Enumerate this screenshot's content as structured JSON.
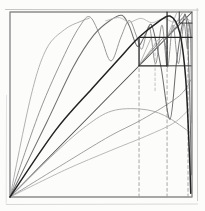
{
  "figure": {
    "background": "#fcfcfb",
    "frame_px": {
      "left": 10,
      "top": 12,
      "right": 192,
      "bottom": 197
    },
    "strokes": [
      {
        "name": "scan-artifact-top",
        "color": "#c6c6c6",
        "width": 1.0,
        "smooth": false,
        "points": [
          [
            -0.025,
            1.0135
          ],
          [
            1.035,
            1.0105
          ]
        ]
      },
      {
        "name": "scan-artifact-right",
        "color": "#c6c6c6",
        "width": 0.9,
        "smooth": false,
        "points": [
          [
            1.0285,
            1.02
          ],
          [
            1.0305,
            -0.02
          ]
        ]
      },
      {
        "name": "scan-artifact-bottom",
        "color": "#d9d9d9",
        "width": 1.0,
        "smooth": false,
        "points": [
          [
            -0.02,
            -0.0405
          ],
          [
            1.03,
            -0.038
          ]
        ]
      },
      {
        "name": "scan-artifact-left",
        "color": "#e0e0e0",
        "width": 0.9,
        "smooth": false,
        "points": [
          [
            -0.019,
            0.55
          ],
          [
            -0.021,
            -0.035
          ]
        ]
      },
      {
        "name": "outer-square-border",
        "color": "#8a8a8a",
        "width": 1.4,
        "smooth": false,
        "points": [
          [
            0,
            0
          ],
          [
            1,
            0
          ],
          [
            1,
            1
          ],
          [
            0,
            1
          ],
          [
            0,
            0
          ]
        ]
      },
      {
        "name": "dashed-vertical-left",
        "color": "#9e9e9e",
        "width": 0.9,
        "dash": [
          3,
          2.7
        ],
        "smooth": false,
        "points": [
          [
            0.709,
            0
          ],
          [
            0.709,
            0.705
          ]
        ]
      },
      {
        "name": "dashed-vertical-middle",
        "color": "#9e9e9e",
        "width": 0.9,
        "dash": [
          3,
          2.7
        ],
        "smooth": false,
        "points": [
          [
            0.863,
            0
          ],
          [
            0.863,
            0.86
          ]
        ]
      },
      {
        "name": "dashed-vertical-right",
        "color": "#9e9e9e",
        "width": 0.9,
        "dash": [
          3,
          2.7
        ],
        "smooth": false,
        "points": [
          [
            0.978,
            0
          ],
          [
            0.978,
            0.935
          ]
        ]
      },
      {
        "name": "dashed-vertical-inside-box",
        "color": "#b4b4b4",
        "width": 0.8,
        "dash": [
          2.6,
          2.4
        ],
        "smooth": false,
        "points": [
          [
            0.797,
            0.575
          ],
          [
            0.797,
            0.858
          ]
        ]
      },
      {
        "name": "diagonal-identity-line",
        "color": "#4f4f4f",
        "width": 1.05,
        "smooth": false,
        "points": [
          [
            0,
            0
          ],
          [
            1,
            1
          ]
        ]
      },
      {
        "name": "shallow-arc-lowest",
        "color": "#b5b5b5",
        "width": 0.95,
        "smooth": true,
        "points": [
          [
            0,
            0
          ],
          [
            0.3,
            0.145
          ],
          [
            0.55,
            0.25
          ],
          [
            0.75,
            0.33
          ],
          [
            0.9,
            0.4
          ],
          [
            0.985,
            0.475
          ]
        ]
      },
      {
        "name": "shallow-arc-dome",
        "color": "#ababab",
        "width": 0.95,
        "smooth": true,
        "points": [
          [
            0,
            0
          ],
          [
            0.25,
            0.24
          ],
          [
            0.42,
            0.385
          ],
          [
            0.56,
            0.465
          ],
          [
            0.72,
            0.475
          ],
          [
            0.85,
            0.44
          ],
          [
            0.995,
            0.345
          ]
        ]
      },
      {
        "name": "shallow-arc-upper",
        "color": "#9c9c9c",
        "width": 0.95,
        "smooth": true,
        "points": [
          [
            0,
            0
          ],
          [
            0.33,
            0.2
          ],
          [
            0.55,
            0.33
          ],
          [
            0.709,
            0.41
          ],
          [
            0.863,
            0.5
          ],
          [
            0.95,
            0.565
          ],
          [
            0.995,
            0.635
          ]
        ]
      },
      {
        "name": "iterate-curve-steepest-ray",
        "color": "#adadad",
        "width": 0.95,
        "smooth": true,
        "points": [
          [
            0,
            0
          ],
          [
            0.115,
            0.545
          ],
          [
            0.2,
            0.8
          ],
          [
            0.3,
            0.905
          ],
          [
            0.385,
            0.948
          ],
          [
            0.435,
            0.966
          ]
        ]
      },
      {
        "name": "iterate-curve-two-humps",
        "color": "#919191",
        "width": 0.95,
        "smooth": true,
        "points": [
          [
            0,
            0
          ],
          [
            0.16,
            0.455
          ],
          [
            0.3,
            0.77
          ],
          [
            0.385,
            0.925
          ],
          [
            0.44,
            0.973
          ],
          [
            0.5,
            0.86
          ],
          [
            0.555,
            0.735
          ],
          [
            0.61,
            0.865
          ],
          [
            0.655,
            0.955
          ],
          [
            0.695,
            0.87
          ],
          [
            0.725,
            0.8
          ],
          [
            0.765,
            0.92
          ],
          [
            0.8,
            0.72
          ],
          [
            0.835,
            0.93
          ],
          [
            0.865,
            0.7
          ],
          [
            0.895,
            0.93
          ],
          [
            0.925,
            0.72
          ],
          [
            0.955,
            0.935
          ],
          [
            0.975,
            0.8
          ],
          [
            0.99,
            0.93
          ],
          [
            0.998,
            0.4
          ]
        ]
      },
      {
        "name": "iterate-curve-narrow-peak",
        "color": "#6e6e6e",
        "width": 1.05,
        "smooth": true,
        "points": [
          [
            0,
            0
          ],
          [
            0.2,
            0.4
          ],
          [
            0.346,
            0.7
          ],
          [
            0.46,
            0.875
          ],
          [
            0.555,
            0.958
          ],
          [
            0.615,
            0.982
          ],
          [
            0.655,
            0.925
          ],
          [
            0.7,
            0.815
          ],
          [
            0.745,
            0.88
          ],
          [
            0.78,
            0.925
          ],
          [
            0.83,
            0.7
          ],
          [
            0.879,
            0.42
          ],
          [
            0.915,
            0.73
          ],
          [
            0.947,
            0.935
          ],
          [
            0.968,
            0.962
          ],
          [
            0.986,
            0.6
          ],
          [
            0.996,
            0.12
          ]
        ]
      },
      {
        "name": "near-top-wiggle-streak",
        "color": "#b5b5b5",
        "width": 0.85,
        "smooth": true,
        "points": [
          [
            0.525,
            0.952
          ],
          [
            0.6,
            0.97
          ],
          [
            0.655,
            0.945
          ],
          [
            0.72,
            0.966
          ],
          [
            0.78,
            0.942
          ],
          [
            0.845,
            0.965
          ],
          [
            0.9,
            0.945
          ],
          [
            0.955,
            0.966
          ],
          [
            0.992,
            0.952
          ]
        ]
      },
      {
        "name": "mini-ray-box1-a",
        "color": "#a8a8a8",
        "width": 0.8,
        "smooth": false,
        "points": [
          [
            0.709,
            0.709
          ],
          [
            0.775,
            0.86
          ]
        ]
      },
      {
        "name": "mini-ray-box1-b",
        "color": "#a8a8a8",
        "width": 0.8,
        "smooth": false,
        "points": [
          [
            0.709,
            0.709
          ],
          [
            0.822,
            0.86
          ]
        ]
      },
      {
        "name": "mini-map-curve-box1",
        "color": "#767676",
        "width": 0.9,
        "smooth": true,
        "points": [
          [
            0.709,
            0.709
          ],
          [
            0.77,
            0.782
          ],
          [
            0.816,
            0.832
          ],
          [
            0.843,
            0.856
          ],
          [
            0.856,
            0.8
          ],
          [
            0.861,
            0.715
          ]
        ]
      },
      {
        "name": "mini-ray-box2-a",
        "color": "#a8a8a8",
        "width": 0.8,
        "smooth": false,
        "points": [
          [
            0.863,
            0.863
          ],
          [
            0.916,
            0.996
          ]
        ]
      },
      {
        "name": "mini-ray-box2-b",
        "color": "#a8a8a8",
        "width": 0.8,
        "smooth": false,
        "points": [
          [
            0.863,
            0.863
          ],
          [
            0.948,
            0.996
          ]
        ]
      },
      {
        "name": "mini-map-curve-box2",
        "color": "#767676",
        "width": 0.9,
        "smooth": true,
        "points": [
          [
            0.863,
            0.863
          ],
          [
            0.922,
            0.932
          ],
          [
            0.962,
            0.98
          ],
          [
            0.984,
            0.93
          ],
          [
            0.995,
            0.868
          ]
        ]
      },
      {
        "name": "renormalization-box-1",
        "color": "#262626",
        "width": 1.3,
        "smooth": false,
        "points": [
          [
            0.709,
            0.709
          ],
          [
            0.863,
            0.709
          ],
          [
            0.863,
            0.863
          ],
          [
            0.709,
            0.863
          ],
          [
            0.709,
            0.709
          ]
        ]
      },
      {
        "name": "box2-bottom-level-line",
        "color": "#262626",
        "width": 1.2,
        "smooth": false,
        "points": [
          [
            0.863,
            0.863
          ],
          [
            1,
            0.863
          ]
        ]
      },
      {
        "name": "box1-bottom-level-extension",
        "color": "#3a3a3a",
        "width": 1.0,
        "smooth": false,
        "points": [
          [
            0.863,
            0.709
          ],
          [
            0.995,
            0.709
          ]
        ]
      },
      {
        "name": "box2-left-edge",
        "color": "#262626",
        "width": 1.2,
        "smooth": false,
        "points": [
          [
            0.863,
            0.863
          ],
          [
            0.863,
            1
          ]
        ]
      },
      {
        "name": "renormalization-box-3",
        "color": "#3a3a3a",
        "width": 1.0,
        "smooth": false,
        "points": [
          [
            0.93,
            1
          ],
          [
            0.93,
            0.94
          ],
          [
            1,
            0.94
          ]
        ]
      },
      {
        "name": "main-map-curve",
        "color": "#222222",
        "width": 1.5,
        "smooth": true,
        "points": [
          [
            0,
            0
          ],
          [
            0.25,
            0.36
          ],
          [
            0.45,
            0.585
          ],
          [
            0.593,
            0.74
          ],
          [
            0.7,
            0.855
          ],
          [
            0.8,
            0.936
          ],
          [
            0.879,
            0.978
          ],
          [
            0.932,
            0.89
          ],
          [
            0.965,
            0.645
          ],
          [
            0.985,
            0.25
          ],
          [
            0.993,
            0.02
          ]
        ]
      }
    ]
  }
}
